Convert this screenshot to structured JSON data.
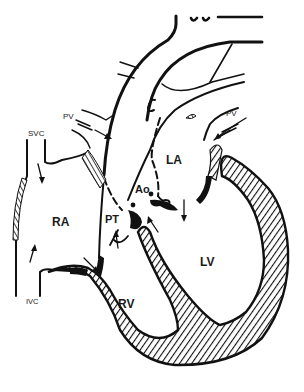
{
  "diagram": {
    "labels": {
      "svc": "SVC",
      "ivc": "IVC",
      "pv_left": "PV",
      "pv_right": "PV",
      "ra": "RA",
      "rv": "RV",
      "la": "LA",
      "lv": "LV",
      "pt": "PT",
      "ao": "Ao"
    },
    "colors": {
      "ink": "#111111",
      "background": "#ffffff",
      "hatch": "#111111"
    }
  }
}
